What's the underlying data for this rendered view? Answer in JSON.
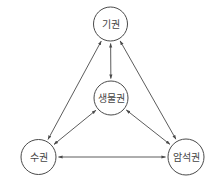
{
  "diagram": {
    "title": "",
    "colors": {
      "stroke": "#4a4a4a",
      "text": "#444444",
      "background": "#ffffff"
    },
    "nodes": [
      {
        "id": "atmosphere",
        "label": "기권",
        "cx": 110.5,
        "cy": 24,
        "r": 17
      },
      {
        "id": "biosphere",
        "label": "생물권",
        "cx": 111,
        "cy": 98,
        "r": 17
      },
      {
        "id": "hydrosphere",
        "label": "수권",
        "cx": 38.5,
        "cy": 157,
        "r": 17.5
      },
      {
        "id": "geosphere",
        "label": "암석권",
        "cx": 186,
        "cy": 157,
        "r": 18
      }
    ],
    "edges": [
      {
        "from": "atmosphere",
        "to": "biosphere",
        "type": "bidirectional"
      },
      {
        "from": "atmosphere",
        "to": "hydrosphere",
        "type": "bidirectional"
      },
      {
        "from": "atmosphere",
        "to": "geosphere",
        "type": "bidirectional"
      },
      {
        "from": "biosphere",
        "to": "hydrosphere",
        "type": "bidirectional"
      },
      {
        "from": "biosphere",
        "to": "geosphere",
        "type": "bidirectional"
      },
      {
        "from": "hydrosphere",
        "to": "geosphere",
        "type": "bidirectional"
      }
    ]
  }
}
